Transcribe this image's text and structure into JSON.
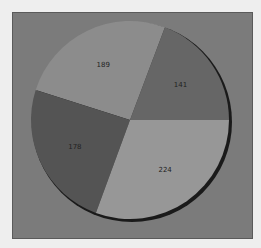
{
  "chart_data": {
    "type": "pie",
    "title": "",
    "categories": [
      "A",
      "B",
      "C",
      "D"
    ],
    "values": [
      141,
      189,
      178,
      224
    ],
    "labels": [
      "141",
      "189",
      "178",
      "224"
    ],
    "colors": [
      "#666666",
      "#8c8c8c",
      "#545454",
      "#979797"
    ],
    "start_angle_deg": 0,
    "direction": "counterclockwise",
    "legend": "none",
    "shadow": true
  },
  "colors": {
    "page_background": "#eeeeee",
    "frame_background": "#7b7b7b"
  }
}
